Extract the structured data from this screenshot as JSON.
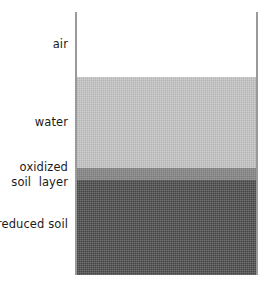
{
  "diagram": {
    "background_color": "#ffffff"
  },
  "column": {
    "wall_color": "#9a9a9a",
    "left_px": 75,
    "right_px": 258,
    "top_px": 12,
    "bottom_px": 275
  },
  "layers": [
    {
      "key": "air",
      "label": "air",
      "color": "#ffffff",
      "top_px": 12,
      "bottom_px": 77
    },
    {
      "key": "water",
      "label": "water",
      "color": "#c9c9c9",
      "top_px": 77,
      "bottom_px": 168
    },
    {
      "key": "oxidized_soil_layer",
      "label": "oxidized\nsoil  layer",
      "label_line1": "oxidized",
      "label_line2": "soil  layer",
      "color": "#8b8b8b",
      "top_px": 168,
      "bottom_px": 180
    },
    {
      "key": "reduced_soil",
      "label": "reduced soil",
      "color": "#565656",
      "top_px": 180,
      "bottom_px": 275
    }
  ],
  "chart_data": {
    "type": "bar",
    "xlabel": "",
    "ylabel": "Depth (vertical profile)",
    "categories": [
      "air",
      "water",
      "oxidized soil layer",
      "reduced soil"
    ],
    "values": [
      65,
      91,
      12,
      95
    ],
    "value_units": "pixels of vertical thickness",
    "colors": [
      "#ffffff",
      "#c9c9c9",
      "#8b8b8b",
      "#565656"
    ],
    "grid": false,
    "legend": "none",
    "orientation": "vertical-stacked",
    "annotations": [
      "air occupies the headspace above the standing water",
      "water column sits over the soil surface",
      "a thin oxidized soil layer forms at the water-soil interface",
      "reduced soil makes up the bulk below the oxidized layer"
    ]
  }
}
